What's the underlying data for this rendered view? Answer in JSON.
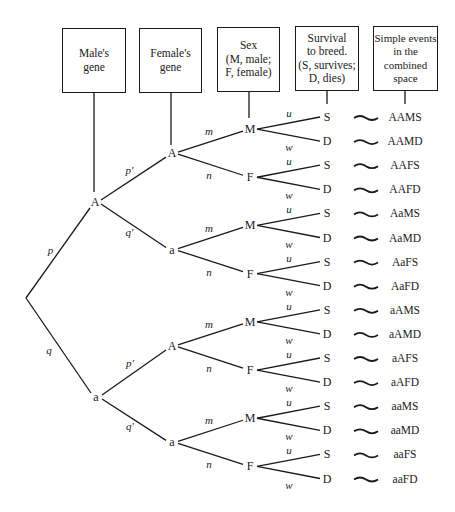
{
  "headers": [
    {
      "id": "male-gene",
      "lines": [
        "Male's",
        "gene"
      ]
    },
    {
      "id": "female-gene",
      "lines": [
        "Female's",
        "gene"
      ]
    },
    {
      "id": "sex",
      "lines": [
        "Sex",
        "(M, male;",
        "F, female)"
      ]
    },
    {
      "id": "survival",
      "lines": [
        "Survival",
        "to breed.",
        "(S, survives;",
        "D, dies)"
      ]
    },
    {
      "id": "simple-events",
      "lines": [
        "Simple events",
        "in the",
        "combined",
        "space"
      ]
    }
  ],
  "root_branches": [
    {
      "prob": "p",
      "node": "A"
    },
    {
      "prob": "q",
      "node": "a"
    }
  ],
  "female_branches": [
    {
      "prob": "p′",
      "node": "A"
    },
    {
      "prob": "q′",
      "node": "a"
    }
  ],
  "sex_branches": [
    {
      "prob": "m",
      "node": "M"
    },
    {
      "prob": "n",
      "node": "F"
    }
  ],
  "survival_branches": [
    {
      "prob": "u",
      "node": "S"
    },
    {
      "prob": "w",
      "node": "D"
    }
  ],
  "correspondence_symbol": "∼",
  "simple_events": [
    "AAMS",
    "AAMD",
    "AAFS",
    "AAFD",
    "AaMS",
    "AaMD",
    "AaFS",
    "AaFD",
    "aAMS",
    "aAMD",
    "aAFS",
    "aAFD",
    "aaMS",
    "aaMD",
    "aaFS",
    "aaFD"
  ]
}
